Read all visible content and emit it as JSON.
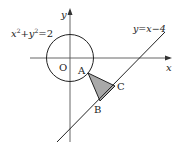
{
  "diagram": {
    "axes": {
      "x_label": "x",
      "y_label": "y",
      "origin_label": "O"
    },
    "circle": {
      "equation": "x²+y²=2",
      "eq_parts": {
        "x": "x",
        "sup1": "2",
        "plus": "+",
        "y": "y",
        "sup2": "2",
        "eq": "=2"
      }
    },
    "line": {
      "equation": "y=x−4"
    },
    "points": {
      "A": "A",
      "B": "B",
      "C": "C"
    },
    "colors": {
      "stroke": "#222222",
      "triangle_fill": "#a9a9a9",
      "axis": "#555555"
    }
  }
}
